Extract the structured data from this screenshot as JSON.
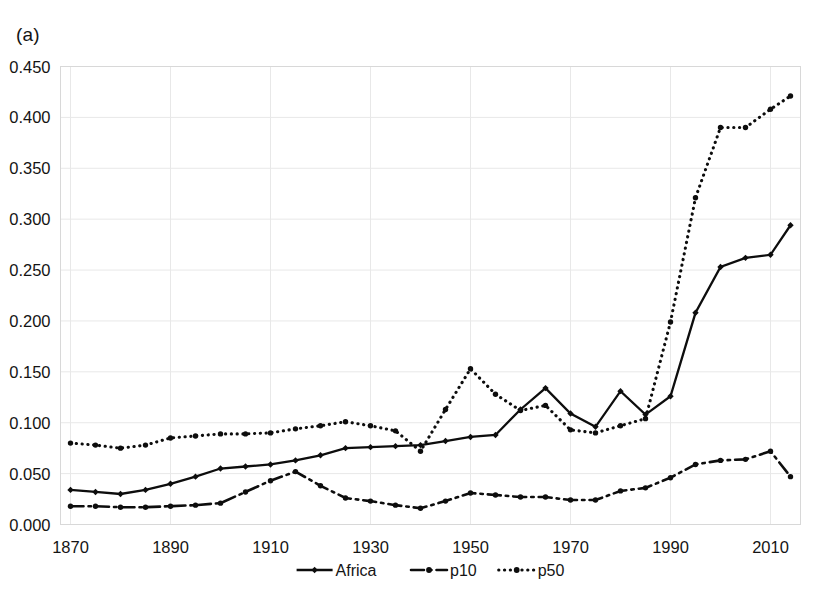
{
  "figure": {
    "panel_label": "(a)",
    "background_color": "#ffffff",
    "ink_color": "#0d0d0d",
    "gridline_color": "#e8e8e8"
  },
  "chart_data": {
    "type": "line",
    "title": "",
    "subtitle": "",
    "xlabel": "",
    "ylabel": "",
    "xlim": [
      1868,
      2016
    ],
    "ylim": [
      0.0,
      0.45
    ],
    "grid": true,
    "legend_position": "bottom-center",
    "x_tick_labels": [
      "1870",
      "1890",
      "1910",
      "1930",
      "1950",
      "1970",
      "1990",
      "2010"
    ],
    "x_ticks": [
      1870,
      1890,
      1910,
      1930,
      1950,
      1970,
      1990,
      2010
    ],
    "y_tick_labels": [
      "0.000",
      "0.050",
      "0.100",
      "0.150",
      "0.200",
      "0.250",
      "0.300",
      "0.350",
      "0.400",
      "0.450"
    ],
    "y_ticks": [
      0.0,
      0.05,
      0.1,
      0.15,
      0.2,
      0.25,
      0.3,
      0.35,
      0.4,
      0.45
    ],
    "x": [
      1870,
      1875,
      1880,
      1885,
      1890,
      1895,
      1900,
      1905,
      1910,
      1915,
      1920,
      1925,
      1930,
      1935,
      1940,
      1945,
      1950,
      1955,
      1960,
      1965,
      1970,
      1975,
      1980,
      1985,
      1990,
      1995,
      2000,
      2005,
      2010,
      2014
    ],
    "series": [
      {
        "name": "Africa",
        "line_style": "solid",
        "marker": "diamond",
        "values": [
          0.034,
          0.032,
          0.03,
          0.034,
          0.04,
          0.047,
          0.055,
          0.057,
          0.059,
          0.063,
          0.068,
          0.075,
          0.076,
          0.077,
          0.078,
          0.082,
          0.086,
          0.088,
          0.113,
          0.134,
          0.109,
          0.096,
          0.131,
          0.108,
          0.126,
          0.208,
          0.253,
          0.262,
          0.265,
          0.294
        ]
      },
      {
        "name": "p10",
        "line_style": "dash-dot",
        "marker": "dot",
        "values": [
          0.018,
          0.018,
          0.017,
          0.017,
          0.018,
          0.019,
          0.021,
          0.032,
          0.043,
          0.052,
          0.038,
          0.026,
          0.023,
          0.019,
          0.016,
          0.023,
          0.031,
          0.029,
          0.027,
          0.027,
          0.024,
          0.024,
          0.033,
          0.036,
          0.046,
          0.059,
          0.063,
          0.064,
          0.072,
          0.047
        ]
      },
      {
        "name": "p50",
        "line_style": "dotted",
        "marker": "dot",
        "values": [
          0.08,
          0.078,
          0.075,
          0.078,
          0.085,
          0.087,
          0.089,
          0.089,
          0.09,
          0.094,
          0.097,
          0.101,
          0.097,
          0.092,
          0.072,
          0.113,
          0.153,
          0.128,
          0.112,
          0.117,
          0.093,
          0.09,
          0.097,
          0.104,
          0.199,
          0.321,
          0.39,
          0.39,
          0.408,
          0.421
        ]
      }
    ]
  },
  "legend": {
    "items": [
      {
        "label": "Africa",
        "style": "solid-with-diamond-marker"
      },
      {
        "label": "p10",
        "style": "dash-dot-with-dot-marker"
      },
      {
        "label": "p50",
        "style": "dotted-with-dot-marker"
      }
    ]
  }
}
